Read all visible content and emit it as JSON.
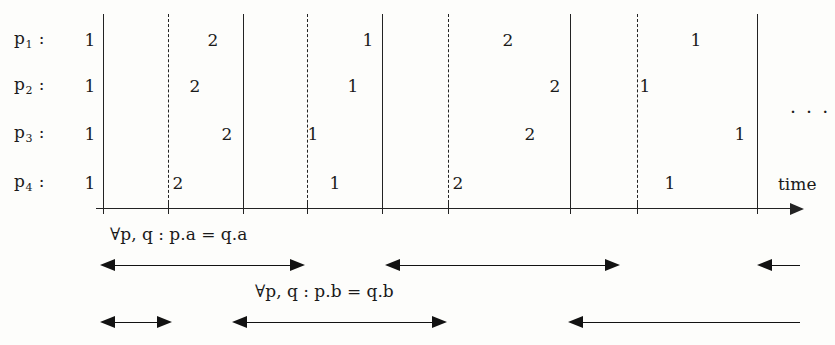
{
  "figure": {
    "ink_color": "#232323",
    "background": "#fdfdfb",
    "axis_label": "time",
    "continuation_dots": "· · ·"
  },
  "processes": [
    {
      "name": "p₁",
      "label": "p",
      "index": "1",
      "colon": ":",
      "y": 40
    },
    {
      "name": "p₂",
      "label": "p",
      "index": "2",
      "colon": ":",
      "y": 86
    },
    {
      "name": "p₃",
      "label": "p",
      "index": "3",
      "colon": ":",
      "y": 134
    },
    {
      "name": "p₄",
      "label": "p",
      "index": "4",
      "colon": ":",
      "y": 183
    }
  ],
  "events": [
    {
      "process": 0,
      "value": "1",
      "x": 90,
      "y": 40
    },
    {
      "process": 0,
      "value": "2",
      "x": 213,
      "y": 40
    },
    {
      "process": 0,
      "value": "1",
      "x": 368,
      "y": 40
    },
    {
      "process": 0,
      "value": "2",
      "x": 508,
      "y": 40
    },
    {
      "process": 0,
      "value": "1",
      "x": 696,
      "y": 40
    },
    {
      "process": 1,
      "value": "1",
      "x": 90,
      "y": 86
    },
    {
      "process": 1,
      "value": "2",
      "x": 195,
      "y": 86
    },
    {
      "process": 1,
      "value": "1",
      "x": 353,
      "y": 86
    },
    {
      "process": 1,
      "value": "2",
      "x": 555,
      "y": 86
    },
    {
      "process": 1,
      "value": "1",
      "x": 645,
      "y": 86
    },
    {
      "process": 2,
      "value": "1",
      "x": 90,
      "y": 134
    },
    {
      "process": 2,
      "value": "2",
      "x": 227,
      "y": 134
    },
    {
      "process": 2,
      "value": "1",
      "x": 313,
      "y": 134
    },
    {
      "process": 2,
      "value": "2",
      "x": 530,
      "y": 134
    },
    {
      "process": 2,
      "value": "1",
      "x": 740,
      "y": 134
    },
    {
      "process": 3,
      "value": "1",
      "x": 90,
      "y": 183
    },
    {
      "process": 3,
      "value": "2",
      "x": 178,
      "y": 183
    },
    {
      "process": 3,
      "value": "1",
      "x": 335,
      "y": 183
    },
    {
      "process": 3,
      "value": "2",
      "x": 458,
      "y": 183
    },
    {
      "process": 3,
      "value": "1",
      "x": 670,
      "y": 183
    }
  ],
  "vertical_lines": [
    {
      "x": 103,
      "style": "solid"
    },
    {
      "x": 168,
      "style": "dashed"
    },
    {
      "x": 243,
      "style": "solid"
    },
    {
      "x": 307,
      "style": "dashed"
    },
    {
      "x": 382,
      "style": "solid"
    },
    {
      "x": 448,
      "style": "dashed"
    },
    {
      "x": 570,
      "style": "solid"
    },
    {
      "x": 637,
      "style": "dashed"
    },
    {
      "x": 757,
      "style": "solid"
    }
  ],
  "axis": {
    "y": 208,
    "x_start": 96,
    "x_end": 790,
    "arrow_x": 790,
    "label": "time",
    "label_x": 778,
    "label_y": 174
  },
  "annotations": {
    "formula_a": "∀p, q : p.a = q.a",
    "formula_a_x": 110,
    "formula_a_y": 224,
    "formula_b": "∀p, q : p.b = q.b",
    "formula_b_x": 255,
    "formula_b_y": 281
  },
  "arrows": [
    {
      "name": "row1-span-1",
      "y": 265,
      "x1": 100,
      "x2": 305,
      "left_head": true,
      "right_head": true
    },
    {
      "name": "row1-span-2",
      "y": 265,
      "x1": 385,
      "x2": 620,
      "left_head": true,
      "right_head": true
    },
    {
      "name": "row1-span-3",
      "y": 265,
      "x1": 757,
      "x2": 800,
      "left_head": true,
      "right_head": false
    },
    {
      "name": "row2-span-1",
      "y": 322,
      "x1": 100,
      "x2": 172,
      "left_head": true,
      "right_head": true
    },
    {
      "name": "row2-span-2",
      "y": 322,
      "x1": 232,
      "x2": 447,
      "left_head": true,
      "right_head": true
    },
    {
      "name": "row2-span-3",
      "y": 322,
      "x1": 568,
      "x2": 800,
      "left_head": true,
      "right_head": false
    }
  ],
  "dots": {
    "x": 790,
    "y": 100,
    "text": "· · ·"
  }
}
